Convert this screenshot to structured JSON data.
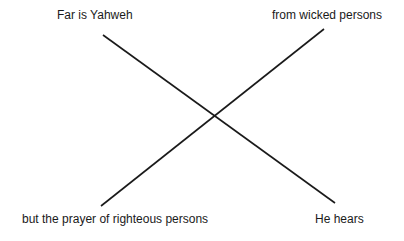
{
  "diagram": {
    "type": "chiasm",
    "labels": {
      "top_left": "Far is Yahweh",
      "top_right": "from wicked persons",
      "bottom_left": "but the prayer of righteous persons",
      "bottom_right": "He hears"
    },
    "lines": [
      {
        "name": "top-left-to-bottom-right",
        "x1": 103,
        "y1": 35,
        "x2": 335,
        "y2": 203
      },
      {
        "name": "top-right-to-bottom-left",
        "x1": 324,
        "y1": 29,
        "x2": 101,
        "y2": 206
      }
    ],
    "line_color": "#1a1a1a",
    "background": "#ffffff"
  }
}
